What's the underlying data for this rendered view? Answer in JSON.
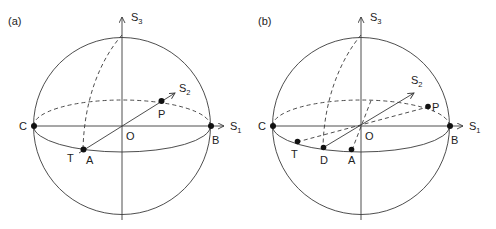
{
  "figure": {
    "panels": [
      {
        "id": "a",
        "label": "(a)",
        "axes": {
          "s1": "S",
          "s1_sub": "1",
          "s2": "S",
          "s2_sub": "2",
          "s3": "S",
          "s3_sub": "3"
        },
        "points": {
          "C": "C",
          "B": "B",
          "O": "O",
          "P": "P",
          "A": "A",
          "T": "T"
        }
      },
      {
        "id": "b",
        "label": "(b)",
        "axes": {
          "s1": "S",
          "s1_sub": "1",
          "s2": "S",
          "s2_sub": "2",
          "s3": "S",
          "s3_sub": "3"
        },
        "points": {
          "C": "C",
          "B": "B",
          "O": "O",
          "P": "P",
          "A": "A",
          "T": "T",
          "D": "D"
        }
      }
    ]
  }
}
